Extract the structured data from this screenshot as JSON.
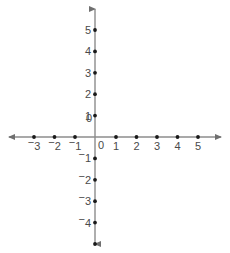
{
  "figure": {
    "width": 230,
    "height": 253,
    "background_color": "#ffffff",
    "axis_color": "#8c8c8c",
    "point_color": "#1a1a1a",
    "label_color": "#4a4a4a"
  },
  "chart_data": {
    "type": "scatter",
    "title": "",
    "subtitle": "",
    "xlabel": "",
    "ylabel": "",
    "xlim": [
      -3.9,
      5.9
    ],
    "ylim": [
      -5.6,
      5.6
    ],
    "grid": false,
    "legend": null,
    "axes": {
      "x_axis": {
        "orientation": "horizontal",
        "arrow_start": true,
        "arrow_end": true,
        "pixel_y": 137,
        "pixel_x_start": 8,
        "pixel_x_end": 222,
        "unit_px": 20.5,
        "origin_px": 95.5
      },
      "y_axis": {
        "orientation": "vertical",
        "arrow_start": true,
        "arrow_end": true,
        "pixel_x": 95,
        "pixel_y_start": 8,
        "pixel_y_end": 245,
        "unit_px": 21.4,
        "origin_px": 137
      }
    },
    "x_ticks": [
      {
        "value": -3,
        "label": "3",
        "negative": true,
        "labeled": true
      },
      {
        "value": -2,
        "label": "2",
        "negative": true,
        "labeled": true
      },
      {
        "value": -1,
        "label": "1",
        "negative": true,
        "labeled": true
      },
      {
        "value": 1,
        "label": "1",
        "negative": false,
        "labeled": true
      },
      {
        "value": 2,
        "label": "2",
        "negative": false,
        "labeled": true
      },
      {
        "value": 3,
        "label": "3",
        "negative": false,
        "labeled": true
      },
      {
        "value": 4,
        "label": "4",
        "negative": false,
        "labeled": true
      },
      {
        "value": 5,
        "label": "5",
        "negative": false,
        "labeled": true
      }
    ],
    "y_ticks": [
      {
        "value": 5,
        "label": "5",
        "negative": false,
        "labeled": true
      },
      {
        "value": 4,
        "label": "4",
        "negative": false,
        "labeled": true
      },
      {
        "value": 3,
        "label": "3",
        "negative": false,
        "labeled": true
      },
      {
        "value": 2,
        "label": "2",
        "negative": false,
        "labeled": true
      },
      {
        "value": 1,
        "label": "1",
        "negative": false,
        "labeled": true
      },
      {
        "value": -1,
        "label": "1",
        "negative": true,
        "labeled": true
      },
      {
        "value": -2,
        "label": "2",
        "negative": true,
        "labeled": true
      },
      {
        "value": -3,
        "label": "3",
        "negative": true,
        "labeled": true
      },
      {
        "value": -4,
        "label": "4",
        "negative": true,
        "labeled": true
      },
      {
        "value": -5,
        "label": "",
        "negative": true,
        "labeled": false
      }
    ],
    "origin_labels": {
      "y_axis_zero": "0",
      "x_axis_zero": "0"
    },
    "points": []
  }
}
